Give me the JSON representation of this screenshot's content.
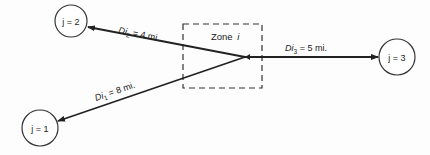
{
  "diagram": {
    "zone": {
      "label_prefix": "Zone",
      "label_var": "i"
    },
    "nodes": [
      {
        "id": "j1",
        "label": "j = 1",
        "cx": 40,
        "cy": 128,
        "r": 18
      },
      {
        "id": "j2",
        "label": "j = 2",
        "cx": 71,
        "cy": 21,
        "r": 16
      },
      {
        "id": "j3",
        "label": "j = 3",
        "cx": 397,
        "cy": 57,
        "r": 18
      }
    ],
    "edges": [
      {
        "to": "j2",
        "label_main": "Di",
        "label_sub": "2",
        "label_rest": " = 4 mi."
      },
      {
        "to": "j1",
        "label_main": "Di",
        "label_sub": "1",
        "label_rest": " = 8 mi."
      },
      {
        "to": "j3",
        "label_main": "Di",
        "label_sub": "3",
        "label_rest": " = 5 mi."
      }
    ]
  }
}
